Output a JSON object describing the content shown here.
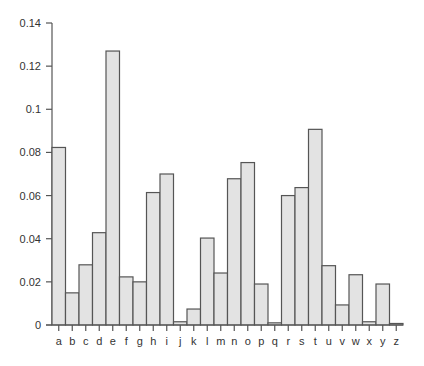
{
  "chart_data": {
    "type": "bar",
    "title": "",
    "xlabel": "",
    "ylabel": "",
    "categories": [
      "a",
      "b",
      "c",
      "d",
      "e",
      "f",
      "g",
      "h",
      "i",
      "j",
      "k",
      "l",
      "m",
      "n",
      "o",
      "p",
      "q",
      "r",
      "s",
      "t",
      "u",
      "v",
      "w",
      "x",
      "y",
      "z"
    ],
    "values": [
      0.0823,
      0.0149,
      0.0279,
      0.0428,
      0.127,
      0.0223,
      0.02,
      0.0614,
      0.07,
      0.0015,
      0.0074,
      0.0403,
      0.0241,
      0.0678,
      0.0753,
      0.019,
      0.001,
      0.06,
      0.0637,
      0.0907,
      0.0275,
      0.0093,
      0.0233,
      0.0015,
      0.019,
      0.0007
    ],
    "ylim": [
      0,
      0.14
    ],
    "yticks": [
      "0",
      "0.02",
      "0.04",
      "0.06",
      "0.08",
      "0.1",
      "0.12",
      "0.14"
    ],
    "grid": false,
    "legend": null,
    "colors": {
      "bar_fill": "#e3e3e3",
      "bar_stroke": "#555555",
      "axis": "#555555",
      "text": "#333333"
    }
  }
}
